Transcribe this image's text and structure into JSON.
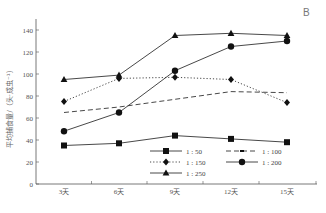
{
  "panel_label": "B",
  "chart_data": {
    "type": "line",
    "title": "",
    "xlabel": "",
    "ylabel": "平均捕食量/（头·成虫⁻¹）",
    "categories": [
      "3天",
      "6天",
      "9天",
      "12天",
      "15天"
    ],
    "ylim": [
      0,
      150
    ],
    "yticks": [
      0,
      20,
      40,
      60,
      80,
      100,
      120,
      140
    ],
    "grid": false,
    "legend_position": "lower-right inside",
    "series": [
      {
        "name": "1 : 50",
        "marker": "square",
        "line": "solid",
        "values": [
          35,
          37,
          44,
          41,
          38
        ]
      },
      {
        "name": "1 : 100",
        "marker": "none",
        "line": "dashed",
        "values": [
          65,
          70,
          77,
          84,
          83
        ]
      },
      {
        "name": "1 : 150",
        "marker": "diamond",
        "line": "dotted",
        "values": [
          75,
          96,
          97,
          95,
          74
        ]
      },
      {
        "name": "1 : 200",
        "marker": "circle",
        "line": "solid",
        "values": [
          48,
          65,
          103,
          125,
          130
        ]
      },
      {
        "name": "1 : 250",
        "marker": "triangle",
        "line": "solid",
        "values": [
          95,
          99,
          135,
          137,
          135
        ]
      }
    ]
  }
}
